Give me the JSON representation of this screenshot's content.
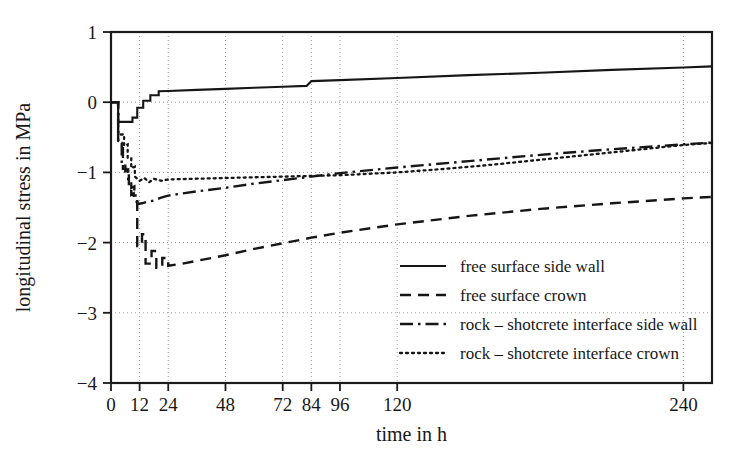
{
  "chart_data": {
    "type": "line",
    "title": "",
    "xlabel": "time in h",
    "ylabel": "longitudinal stress in MPa",
    "xlim": [
      0,
      252
    ],
    "ylim": [
      -4,
      1
    ],
    "grid": true,
    "legend_position": "lower-right-inside",
    "xticks": [
      0,
      12,
      24,
      48,
      72,
      84,
      96,
      120,
      240
    ],
    "xtick_labels": [
      "0",
      "12",
      "24",
      "48",
      "72",
      "84",
      "96",
      "120",
      "240"
    ],
    "yticks": [
      -4,
      -3,
      -2,
      -1,
      0,
      1
    ],
    "ytick_labels": [
      "-4",
      "-3",
      "-2",
      "-1",
      "0",
      "1"
    ],
    "series": [
      {
        "name": "free surface side wall",
        "style": "solid",
        "points": [
          [
            0,
            0.0
          ],
          [
            3.0,
            0.0
          ],
          [
            3.0,
            -0.28
          ],
          [
            9.0,
            -0.28
          ],
          [
            9.0,
            -0.22
          ],
          [
            11.0,
            -0.22
          ],
          [
            11.0,
            -0.08
          ],
          [
            13.5,
            -0.08
          ],
          [
            13.5,
            0.02
          ],
          [
            16.5,
            0.02
          ],
          [
            16.5,
            0.1
          ],
          [
            20.0,
            0.1
          ],
          [
            20.0,
            0.155
          ],
          [
            24.0,
            0.16
          ],
          [
            36.0,
            0.175
          ],
          [
            48.0,
            0.19
          ],
          [
            60.0,
            0.205
          ],
          [
            72.0,
            0.22
          ],
          [
            82.0,
            0.232
          ],
          [
            84.0,
            0.3
          ],
          [
            96.0,
            0.315
          ],
          [
            120.0,
            0.345
          ],
          [
            150.0,
            0.385
          ],
          [
            180.0,
            0.42
          ],
          [
            210.0,
            0.46
          ],
          [
            240.0,
            0.495
          ],
          [
            252.0,
            0.51
          ]
        ]
      },
      {
        "name": "free surface crown",
        "style": "dashed",
        "points": [
          [
            0,
            0.0
          ],
          [
            3.0,
            0.0
          ],
          [
            3.0,
            -0.55
          ],
          [
            5.0,
            -0.62
          ],
          [
            5.0,
            -0.95
          ],
          [
            6.5,
            -0.95
          ],
          [
            6.5,
            -1.05
          ],
          [
            7.5,
            -1.02
          ],
          [
            7.5,
            -1.22
          ],
          [
            8.5,
            -1.22
          ],
          [
            8.5,
            -1.32
          ],
          [
            9.5,
            -1.3
          ],
          [
            9.5,
            -1.42
          ],
          [
            11.0,
            -1.42
          ],
          [
            11.0,
            -2.05
          ],
          [
            13.0,
            -2.05
          ],
          [
            13.0,
            -1.88
          ],
          [
            14.5,
            -1.88
          ],
          [
            14.5,
            -2.3
          ],
          [
            17.0,
            -2.3
          ],
          [
            17.0,
            -2.12
          ],
          [
            19.0,
            -2.12
          ],
          [
            19.0,
            -2.36
          ],
          [
            21.5,
            -2.36
          ],
          [
            21.5,
            -2.22
          ],
          [
            24.0,
            -2.22
          ],
          [
            24.0,
            -2.33
          ],
          [
            30.0,
            -2.3
          ],
          [
            36.0,
            -2.26
          ],
          [
            48.0,
            -2.18
          ],
          [
            60.0,
            -2.09
          ],
          [
            72.0,
            -2.01
          ],
          [
            84.0,
            -1.93
          ],
          [
            96.0,
            -1.86
          ],
          [
            120.0,
            -1.74
          ],
          [
            150.0,
            -1.62
          ],
          [
            180.0,
            -1.52
          ],
          [
            210.0,
            -1.44
          ],
          [
            240.0,
            -1.37
          ],
          [
            252.0,
            -1.35
          ]
        ]
      },
      {
        "name": "rock – shotcrete interface side wall",
        "style": "dashdot",
        "points": [
          [
            0,
            0.0
          ],
          [
            3.0,
            0.0
          ],
          [
            3.0,
            -0.58
          ],
          [
            4.5,
            -0.58
          ],
          [
            4.5,
            -0.85
          ],
          [
            6.0,
            -0.85
          ],
          [
            6.0,
            -0.98
          ],
          [
            7.2,
            -0.96
          ],
          [
            7.2,
            -1.12
          ],
          [
            8.5,
            -1.12
          ],
          [
            8.5,
            -1.22
          ],
          [
            9.8,
            -1.2
          ],
          [
            9.8,
            -1.33
          ],
          [
            11.0,
            -1.33
          ],
          [
            11.0,
            -1.45
          ],
          [
            13.0,
            -1.44
          ],
          [
            15.0,
            -1.42
          ],
          [
            18.0,
            -1.4
          ],
          [
            21.0,
            -1.36
          ],
          [
            24.0,
            -1.33
          ],
          [
            36.0,
            -1.27
          ],
          [
            48.0,
            -1.22
          ],
          [
            60.0,
            -1.16
          ],
          [
            72.0,
            -1.11
          ],
          [
            84.0,
            -1.06
          ],
          [
            96.0,
            -1.01
          ],
          [
            120.0,
            -0.93
          ],
          [
            150.0,
            -0.84
          ],
          [
            180.0,
            -0.75
          ],
          [
            210.0,
            -0.67
          ],
          [
            240.0,
            -0.6
          ],
          [
            252.0,
            -0.575
          ]
        ]
      },
      {
        "name": "rock – shotcrete interface crown",
        "style": "dotted",
        "points": [
          [
            0,
            0.0
          ],
          [
            3.0,
            0.0
          ],
          [
            3.0,
            -0.46
          ],
          [
            5.5,
            -0.46
          ],
          [
            5.5,
            -0.62
          ],
          [
            7.0,
            -0.6
          ],
          [
            7.0,
            -0.8
          ],
          [
            8.5,
            -0.8
          ],
          [
            8.5,
            -0.94
          ],
          [
            10.0,
            -0.92
          ],
          [
            10.0,
            -1.06
          ],
          [
            12.0,
            -1.12
          ],
          [
            14.0,
            -1.08
          ],
          [
            16.0,
            -1.14
          ],
          [
            18.0,
            -1.09
          ],
          [
            21.0,
            -1.12
          ],
          [
            24.0,
            -1.1
          ],
          [
            36.0,
            -1.09
          ],
          [
            48.0,
            -1.08
          ],
          [
            60.0,
            -1.07
          ],
          [
            72.0,
            -1.06
          ],
          [
            84.0,
            -1.05
          ],
          [
            96.0,
            -1.04
          ],
          [
            108.0,
            -1.02
          ],
          [
            120.0,
            -1.0
          ],
          [
            140.0,
            -0.95
          ],
          [
            160.0,
            -0.89
          ],
          [
            180.0,
            -0.82
          ],
          [
            200.0,
            -0.75
          ],
          [
            220.0,
            -0.68
          ],
          [
            240.0,
            -0.61
          ],
          [
            252.0,
            -0.58
          ]
        ]
      }
    ]
  },
  "legend": {
    "entries": [
      {
        "label": "free surface side wall",
        "style": "solid"
      },
      {
        "label": "free surface crown",
        "style": "dashed"
      },
      {
        "label": "rock – shotcrete interface side wall",
        "style": "dashdot"
      },
      {
        "label": "rock – shotcrete interface crown",
        "style": "dotted"
      }
    ]
  },
  "colors": {
    "line": "#161616",
    "grid": "#9a9a9a",
    "axis": "#1a1a1a",
    "background": "#ffffff"
  }
}
